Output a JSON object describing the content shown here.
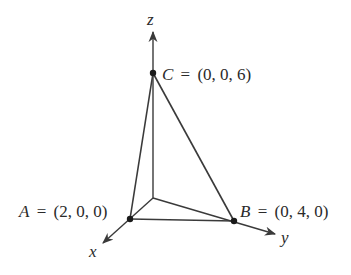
{
  "diagram": {
    "type": "3d-coordinate-tetrahedron",
    "axes": {
      "x": {
        "label": "x"
      },
      "y": {
        "label": "y"
      },
      "z": {
        "label": "z"
      }
    },
    "points": {
      "A": {
        "name": "A",
        "coords": "(2, 0, 0)"
      },
      "B": {
        "name": "B",
        "coords": "(0, 4, 0)"
      },
      "C": {
        "name": "C",
        "coords": "(0, 0, 6)"
      }
    },
    "equals": "=",
    "colors": {
      "line": "#3a3a3a",
      "text": "#2a2a2a",
      "background": "#ffffff"
    }
  }
}
